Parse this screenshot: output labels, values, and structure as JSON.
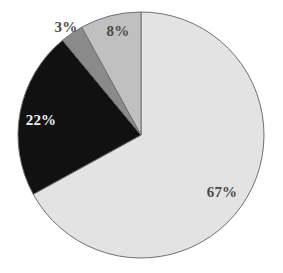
{
  "chart_data": {
    "type": "pie",
    "title": "",
    "subtitle": "",
    "xlabel": "",
    "ylabel": "",
    "grid": false,
    "legend": "none",
    "start_angle_deg": 0,
    "direction": "clockwise",
    "center": {
      "x": 141,
      "y": 135
    },
    "radius": 123,
    "background": "#ffffff",
    "outline_color": "#6f6f6f",
    "labels": [
      "67%",
      "22%",
      "3%",
      "8%"
    ],
    "values": [
      67,
      22,
      3,
      8
    ],
    "colors": [
      "#e3e3e3",
      "#111111",
      "#8a8a8a",
      "#c0c0c0"
    ],
    "slices": [
      {
        "label": "67%",
        "value": 67,
        "color": "#e3e3e3",
        "start_deg": 0,
        "end_deg": 241.2,
        "label_color": "#4a4a4a",
        "label_x": 222,
        "label_y": 192
      },
      {
        "label": "22%",
        "value": 22,
        "color": "#111111",
        "start_deg": 241.2,
        "end_deg": 320.4,
        "label_color": "#f2f2f2",
        "label_x": 41,
        "label_y": 120
      },
      {
        "label": "3%",
        "value": 3,
        "color": "#8a8a8a",
        "start_deg": 320.4,
        "end_deg": 331.2,
        "label_color": "#4a4a4a",
        "label_x": 66,
        "label_y": 27
      },
      {
        "label": "8%",
        "value": 8,
        "color": "#c0c0c0",
        "start_deg": 331.2,
        "end_deg": 360,
        "label_color": "#4a4a4a",
        "label_x": 118,
        "label_y": 31
      }
    ]
  }
}
